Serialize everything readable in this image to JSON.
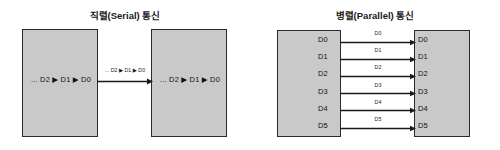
{
  "figure": {
    "background_color": "#ffffff",
    "box_fill_color": "#c9c9c9",
    "box_border_color": "#2b2b2b",
    "line_color": "#1a1a1a",
    "text_color": "#111111"
  },
  "serial": {
    "title": "직렬(Serial) 통신",
    "left_box_stream": "... D2 ▶ D1 ▶ D0",
    "right_box_stream": "... D2 ▶ D1 ▶ D0",
    "wire_label": "... D2 ▶ D1 ▶ D0",
    "arrow_direction": "left-to-right"
  },
  "parallel": {
    "title": "병렬(Parallel) 통신",
    "lanes": [
      {
        "left_label": "D0",
        "wire_label": "D0",
        "right_label": "D0"
      },
      {
        "left_label": "D1",
        "wire_label": "D1",
        "right_label": "D1"
      },
      {
        "left_label": "D2",
        "wire_label": "D2",
        "right_label": "D2"
      },
      {
        "left_label": "D3",
        "wire_label": "D3",
        "right_label": "D3"
      },
      {
        "left_label": "D4",
        "wire_label": "D4",
        "right_label": "D4"
      },
      {
        "left_label": "D5",
        "wire_label": "D5",
        "right_label": "D5"
      }
    ],
    "arrow_direction": "left-to-right"
  }
}
